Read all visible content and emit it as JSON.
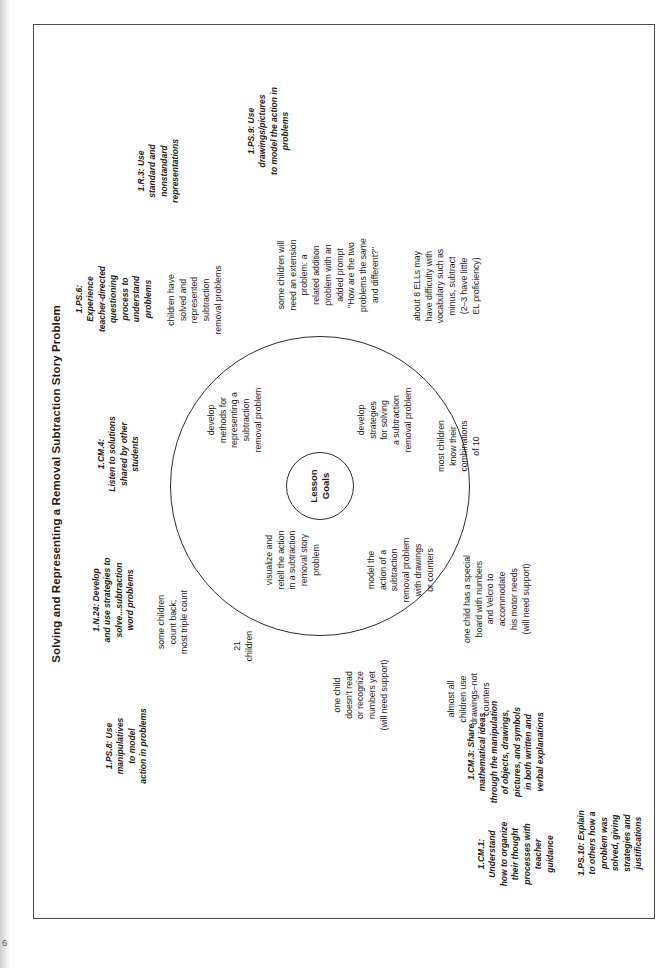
{
  "document": {
    "page_number": "6",
    "title": "Solving and Representing a Removal Subtraction Story Problem",
    "center_label": "Lesson\nGoals"
  },
  "standards": [
    {
      "id": "1.PS.8",
      "text": "1.PS.8: Use\nmanipulatives\nto model\naction in problems"
    },
    {
      "id": "1.N.24",
      "text": "1.N.24: Develop\nand use strategies to\nsolve...subtraction\nword problems"
    },
    {
      "id": "1.CM.4",
      "text": "1.CM.4:\nListen to solutions\nshared by other\nstudents"
    },
    {
      "id": "1.PS.6",
      "text": "1.PS.6:\nExperience\nteacher-directed\nquestioning\nprocess to\nunderstand\nproblems"
    },
    {
      "id": "1.R.3",
      "text": "1.R.3: Use\nstandard and\nnonstandard\nrepresentations"
    },
    {
      "id": "1.PS.9",
      "text": "1.PS.9: Use\ndrawings/pictures\nto model the action in\nproblems"
    },
    {
      "id": "1.CM.3",
      "text": "1.CM.3: Share\nmathematical ideas\nthrough the manipulation\nof objects, drawings,\npictures, and symbols\nin both written and\nverbal explanations"
    },
    {
      "id": "1.CM.1",
      "text": "1.CM.1:\nUnderstand\nhow to organize\ntheir thought\nprocesses with\nteacher\nguidance"
    },
    {
      "id": "1.PS.10",
      "text": "1.PS.10: Explain\nto others how a\nproblem was\nsolved, giving\nstrategies and\njustifications"
    }
  ],
  "goals": [
    {
      "text": "visualize and\nretell the action\nin a subtraction\nremoval story\nproblem"
    },
    {
      "text": "develop\nmethods for\nrepresenting a\nsubtraction\nremoval problem"
    },
    {
      "text": "develop\nstrategies\nfor solving\na subtraction\nremoval problem"
    },
    {
      "text": "model the\naction of a\nsubtraction\nremoval problem\nwith drawings\nor counters"
    }
  ],
  "notes": [
    {
      "text": "21\nchildren"
    },
    {
      "text": "some children\ncount back;\nmost triple count"
    },
    {
      "text": "children have\nsolved and\nrepresented\nsubtraction\nremoval problems"
    },
    {
      "text": "some children will\nneed an extension\nproblem: a\nrelated addition\nproblem with an\nadded prompt\n\"How are the two\nproblems the same\nand different?\""
    },
    {
      "text": "about 8 ELLs may\nhave difficulty with\nvocabulary such as\nminus, subtract\n(2–3 have little\nEL proficiency)"
    },
    {
      "text": "most children\nknow their\ncombinations\nof 10"
    },
    {
      "text": "one child has a special\nboard with numbers\nand Velcro to\naccommodate\nhis motor needs\n(will need support)"
    },
    {
      "text": "almost all\nchildren use\ndrawings–not\ncounters"
    },
    {
      "text": "one child\ndoesn't read\nor recognize\nnumbers yet\n(will need support)"
    }
  ]
}
